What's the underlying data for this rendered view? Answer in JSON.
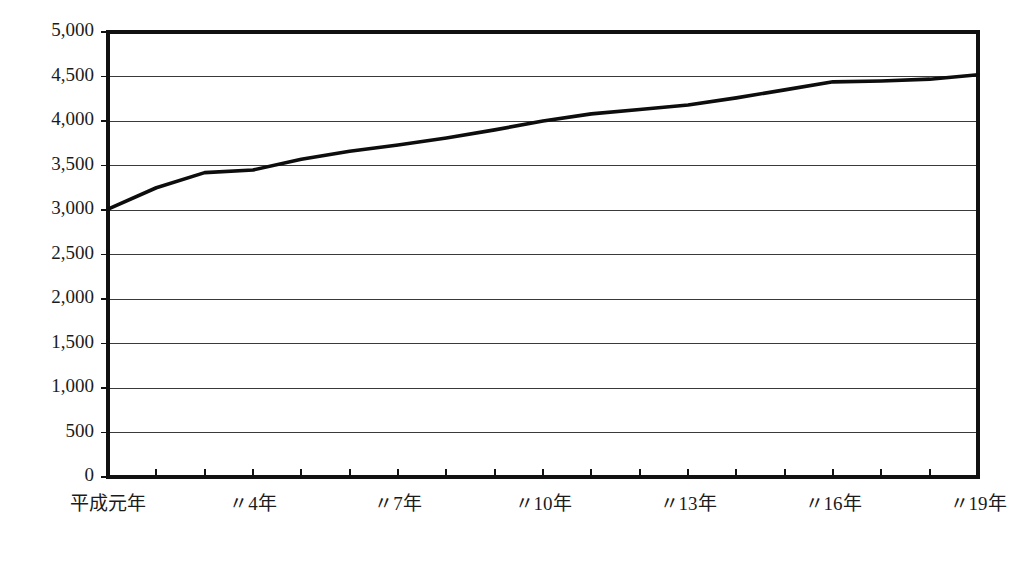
{
  "figure": {
    "background_color": "#ffffff",
    "line_color": "#0d0d0d",
    "grid_color": "#3a3a3a",
    "axis_color": "#111111"
  },
  "chart_data": {
    "type": "line",
    "title": "",
    "subtitle": "",
    "xlabel": "",
    "ylabel": "",
    "grid": true,
    "legend": false,
    "legend_position": "none",
    "ylim": [
      0,
      5000
    ],
    "ytick_values": [
      0,
      500,
      1000,
      1500,
      2000,
      2500,
      3000,
      3500,
      4000,
      4500,
      5000
    ],
    "ytick_labels": [
      "0",
      "500",
      "1,000",
      "1,500",
      "2,000",
      "2,500",
      "3,000",
      "3,500",
      "4,000",
      "4,500",
      "5,000"
    ],
    "xlim": [
      1,
      19
    ],
    "xtick_values": [
      1,
      4,
      7,
      10,
      13,
      16,
      19
    ],
    "xtick_labels": [
      "平成元年",
      "〃4年",
      "〃7年",
      "〃10年",
      "〃13年",
      "〃16年",
      "〃19年"
    ],
    "x": [
      1,
      2,
      3,
      4,
      5,
      6,
      7,
      8,
      9,
      10,
      11,
      12,
      13,
      14,
      15,
      16,
      17,
      18,
      19
    ],
    "categories": [
      "平成元年",
      "平成2年",
      "平成3年",
      "平成4年",
      "平成5年",
      "平成6年",
      "平成7年",
      "平成8年",
      "平成9年",
      "平成10年",
      "平成11年",
      "平成12年",
      "平成13年",
      "平成14年",
      "平成15年",
      "平成16年",
      "平成17年",
      "平成18年",
      "平成19年"
    ],
    "values": [
      3010,
      3250,
      3420,
      3450,
      3570,
      3660,
      3730,
      3810,
      3900,
      4000,
      4080,
      4130,
      4180,
      4260,
      4350,
      4440,
      4450,
      4470,
      4520
    ],
    "series": [
      {
        "name": "series-1",
        "values": [
          3010,
          3250,
          3420,
          3450,
          3570,
          3660,
          3730,
          3810,
          3900,
          4000,
          4080,
          4130,
          4180,
          4260,
          4350,
          4440,
          4450,
          4470,
          4520
        ]
      }
    ]
  }
}
